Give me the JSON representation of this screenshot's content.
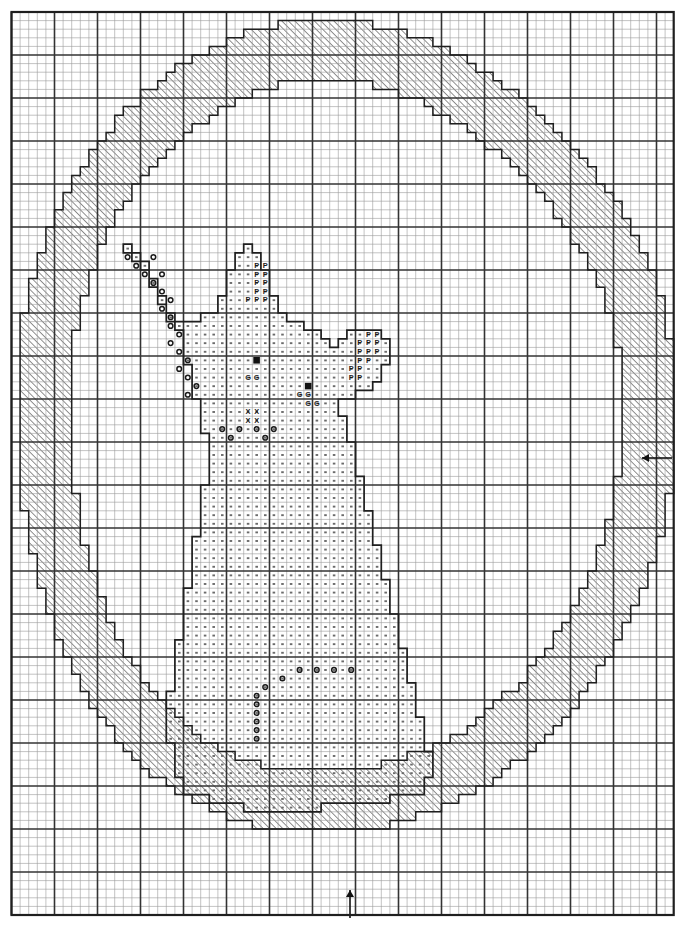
{
  "document": {
    "kind": "cross-stitch-pattern-chart",
    "title": "Cat in Moon Cross Stitch Chart",
    "background_color": "#ffffff",
    "ink_color": "#2b2b2b"
  },
  "grid": {
    "origin_x": 11.5,
    "origin_y": 12.0,
    "cell": 8.6,
    "cols": 77,
    "rows": 105,
    "minor_color": "#9a9a9a",
    "minor_width": 0.6,
    "major_color": "#333333",
    "major_width": 1.6,
    "major_every": 5,
    "border_color": "#1f1f1f",
    "border_width": 2.2
  },
  "legend": {
    "symbols": [
      {
        "key": "hatch",
        "glyph": "",
        "name": "diagonal-hatch-fill",
        "meaning": "moon crescent ring"
      },
      {
        "key": "dot",
        "glyph": "·",
        "name": "dot-fill",
        "meaning": "cat body"
      },
      {
        "key": "circle",
        "glyph": "o",
        "name": "circle-symbol",
        "meaning": "outline shading"
      },
      {
        "key": "P",
        "glyph": "P",
        "name": "p-symbol",
        "meaning": "ear / paw colour"
      },
      {
        "key": "G",
        "glyph": "G",
        "name": "g-symbol",
        "meaning": "eye surround"
      },
      {
        "key": "X",
        "glyph": "X",
        "name": "x-symbol",
        "meaning": "nose / muzzle"
      },
      {
        "key": "solid",
        "glyph": "■",
        "name": "solid-square",
        "meaning": "eye / pupil"
      }
    ]
  },
  "markers": [
    {
      "name": "center-marker-right",
      "direction": "left",
      "x": 672,
      "y": 458,
      "length": 30
    },
    {
      "name": "center-marker-bottom",
      "direction": "up",
      "x": 350,
      "y": 918,
      "length": 28
    }
  ],
  "shapes": {
    "ring_outer": {
      "name": "moon-ring-outer-boundary",
      "note": "stepped circle, cell coordinates (col,row) polygon",
      "points": [
        [
          35,
          2
        ],
        [
          46,
          2
        ],
        [
          53,
          4
        ],
        [
          58,
          7
        ],
        [
          62,
          10
        ],
        [
          66,
          14
        ],
        [
          69,
          18
        ],
        [
          72,
          23
        ],
        [
          74,
          29
        ],
        [
          76,
          36
        ],
        [
          76,
          46
        ],
        [
          76,
          52
        ],
        [
          74,
          60
        ],
        [
          72,
          66
        ],
        [
          69,
          72
        ],
        [
          66,
          77
        ],
        [
          62,
          82
        ],
        [
          58,
          86
        ],
        [
          53,
          90
        ],
        [
          47,
          93
        ],
        [
          40,
          95
        ],
        [
          32,
          95
        ],
        [
          25,
          94
        ],
        [
          19,
          92
        ],
        [
          14,
          89
        ],
        [
          10,
          85
        ],
        [
          6,
          80
        ],
        [
          3,
          74
        ],
        [
          1,
          67
        ],
        [
          0,
          59
        ],
        [
          0,
          45
        ],
        [
          1,
          37
        ],
        [
          3,
          30
        ],
        [
          6,
          24
        ],
        [
          10,
          18
        ],
        [
          14,
          13
        ],
        [
          19,
          9
        ],
        [
          25,
          5
        ],
        [
          30,
          3
        ]
      ]
    },
    "ring_inner": {
      "name": "moon-ring-inner-boundary",
      "points": [
        [
          35,
          9
        ],
        [
          44,
          9
        ],
        [
          50,
          11
        ],
        [
          55,
          14
        ],
        [
          60,
          18
        ],
        [
          64,
          23
        ],
        [
          67,
          29
        ],
        [
          69,
          36
        ],
        [
          70,
          44
        ],
        [
          70,
          53
        ],
        [
          68,
          61
        ],
        [
          65,
          68
        ],
        [
          61,
          74
        ],
        [
          56,
          80
        ],
        [
          50,
          85
        ],
        [
          43,
          88
        ],
        [
          35,
          89
        ],
        [
          27,
          88
        ],
        [
          21,
          85
        ],
        [
          16,
          81
        ],
        [
          12,
          76
        ],
        [
          9,
          70
        ],
        [
          7,
          63
        ],
        [
          6,
          55
        ],
        [
          6,
          44
        ],
        [
          7,
          36
        ],
        [
          9,
          29
        ],
        [
          12,
          23
        ],
        [
          16,
          18
        ],
        [
          21,
          14
        ],
        [
          27,
          11
        ]
      ]
    },
    "cat_outline": {
      "name": "cat-body-outline",
      "note": "stepped silhouette of seated cat"
    }
  },
  "symbol_cells": {
    "note": "col,row index positions (0-based) of lettered symbols",
    "P": [
      [
        28,
        29
      ],
      [
        29,
        29
      ],
      [
        28,
        30
      ],
      [
        29,
        30
      ],
      [
        28,
        31
      ],
      [
        29,
        31
      ],
      [
        28,
        32
      ],
      [
        29,
        32
      ],
      [
        27,
        33
      ],
      [
        28,
        33
      ],
      [
        29,
        33
      ],
      [
        41,
        37
      ],
      [
        42,
        37
      ],
      [
        40,
        38
      ],
      [
        41,
        38
      ],
      [
        42,
        38
      ],
      [
        40,
        39
      ],
      [
        41,
        39
      ],
      [
        42,
        39
      ],
      [
        40,
        40
      ],
      [
        41,
        40
      ],
      [
        39,
        41
      ],
      [
        40,
        41
      ],
      [
        39,
        42
      ],
      [
        40,
        42
      ]
    ],
    "G": [
      [
        27,
        42
      ],
      [
        28,
        42
      ],
      [
        33,
        44
      ],
      [
        34,
        44
      ],
      [
        34,
        45
      ],
      [
        35,
        45
      ]
    ],
    "X": [
      [
        27,
        46
      ],
      [
        28,
        46
      ],
      [
        27,
        47
      ],
      [
        28,
        47
      ]
    ],
    "solid": [
      [
        28,
        40
      ],
      [
        34,
        43
      ]
    ],
    "circle_runs": [
      {
        "name": "head-left-shading",
        "cells": [
          [
            13,
            28
          ],
          [
            16,
            28
          ],
          [
            14,
            29
          ],
          [
            15,
            30
          ],
          [
            17,
            30
          ],
          [
            16,
            31
          ],
          [
            17,
            32
          ],
          [
            18,
            33
          ],
          [
            17,
            34
          ],
          [
            18,
            35
          ],
          [
            18,
            36
          ],
          [
            19,
            37
          ],
          [
            18,
            38
          ],
          [
            19,
            39
          ],
          [
            20,
            40
          ],
          [
            19,
            41
          ],
          [
            20,
            42
          ],
          [
            21,
            43
          ],
          [
            20,
            44
          ]
        ]
      },
      {
        "name": "muzzle-shading",
        "cells": [
          [
            24,
            48
          ],
          [
            26,
            48
          ],
          [
            28,
            48
          ],
          [
            30,
            48
          ],
          [
            25,
            49
          ],
          [
            29,
            49
          ]
        ]
      },
      {
        "name": "chest-shading",
        "cells": [
          [
            33,
            76
          ],
          [
            35,
            76
          ],
          [
            37,
            76
          ],
          [
            39,
            76
          ],
          [
            31,
            77
          ],
          [
            29,
            78
          ],
          [
            28,
            79
          ],
          [
            28,
            80
          ],
          [
            28,
            81
          ],
          [
            28,
            82
          ],
          [
            28,
            83
          ],
          [
            28,
            84
          ]
        ]
      }
    ]
  }
}
